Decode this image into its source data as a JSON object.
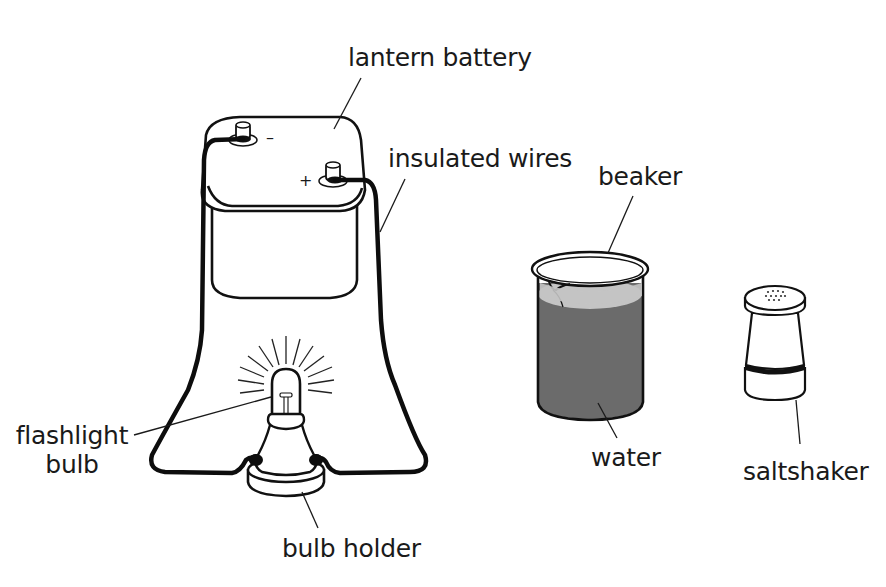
{
  "diagram": {
    "type": "science-apparatus-illustration",
    "colors": {
      "background": "#ffffff",
      "line": "#111111",
      "water_body": "#6b6b6b",
      "water_surface": "#c4c4c4"
    },
    "components": [
      {
        "id": "lantern-battery",
        "label": "lantern battery"
      },
      {
        "id": "insulated-wires",
        "label": "insulated wires"
      },
      {
        "id": "flashlight-bulb",
        "label_lines": [
          "flashlight",
          "bulb"
        ]
      },
      {
        "id": "bulb-holder",
        "label": "bulb holder"
      },
      {
        "id": "beaker",
        "label": "beaker"
      },
      {
        "id": "water",
        "label": "water"
      },
      {
        "id": "saltshaker",
        "label": "saltshaker"
      }
    ],
    "battery_terminals": {
      "negative": "-",
      "positive": "+"
    }
  },
  "labels": {
    "lantern_battery": "lantern battery",
    "insulated_wires": "insulated wires",
    "flashlight_line1": "flashlight",
    "flashlight_line2": "bulb",
    "bulb_holder": "bulb holder",
    "beaker": "beaker",
    "water": "water",
    "saltshaker": "saltshaker",
    "negative_sign": "–",
    "positive_sign": "+"
  }
}
